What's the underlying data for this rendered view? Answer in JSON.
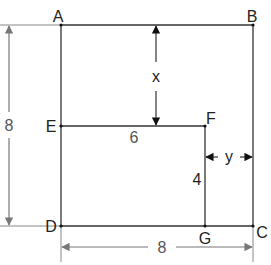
{
  "diagram": {
    "type": "geometry-figure",
    "points": {
      "A": {
        "label": "A",
        "x": 61,
        "y": 25
      },
      "B": {
        "label": "B",
        "x": 253,
        "y": 25
      },
      "C": {
        "label": "C",
        "x": 253,
        "y": 226
      },
      "D": {
        "label": "D",
        "x": 61,
        "y": 226
      },
      "E": {
        "label": "E",
        "x": 61,
        "y": 126
      },
      "F": {
        "label": "F",
        "x": 205,
        "y": 126
      },
      "G": {
        "label": "G",
        "x": 205,
        "y": 226
      }
    },
    "segments": [
      [
        "A",
        "B"
      ],
      [
        "B",
        "C"
      ],
      [
        "C",
        "D"
      ],
      [
        "D",
        "A"
      ],
      [
        "E",
        "F"
      ],
      [
        "F",
        "G"
      ]
    ],
    "measurements": {
      "left_height": "8",
      "bottom_width": "8",
      "EF_length": "6",
      "FG_length": "4",
      "unknown_vertical": "x",
      "unknown_horizontal": "y"
    },
    "colors": {
      "line": "#333333",
      "dimension": "#777777",
      "arrowhead_dark": "#111111"
    }
  }
}
